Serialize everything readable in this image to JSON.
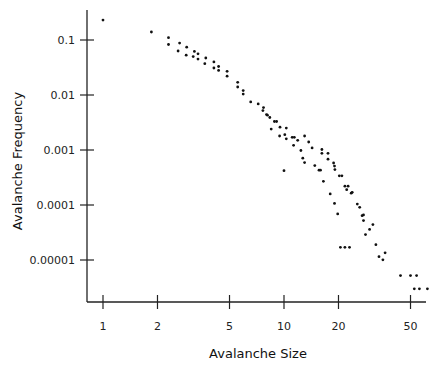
{
  "chart_data": {
    "type": "scatter",
    "title": "",
    "xlabel": "Avalanche Size",
    "ylabel": "Avalanche Frequency",
    "xscale": "log",
    "yscale": "log",
    "xlim": [
      0.88,
      60
    ],
    "ylim": [
      1.8e-06,
      0.36
    ],
    "grid": false,
    "legend": null,
    "x_ticks": [
      {
        "value": 1,
        "label": "1"
      },
      {
        "value": 2,
        "label": "2"
      },
      {
        "value": 5,
        "label": "5"
      },
      {
        "value": 10,
        "label": "10"
      },
      {
        "value": 20,
        "label": "20"
      },
      {
        "value": 50,
        "label": "50"
      }
    ],
    "y_ticks": [
      {
        "value": 0.1,
        "label": "0.1"
      },
      {
        "value": 0.01,
        "label": "0.01"
      },
      {
        "value": 0.001,
        "label": "0.001"
      },
      {
        "value": 0.0001,
        "label": "0.0001"
      },
      {
        "value": 1e-05,
        "label": "0.00001"
      }
    ],
    "points": [
      [
        1.0,
        0.23
      ],
      [
        1.85,
        0.14
      ],
      [
        2.3,
        0.11
      ],
      [
        2.3,
        0.083
      ],
      [
        2.65,
        0.088
      ],
      [
        2.6,
        0.063
      ],
      [
        2.9,
        0.074
      ],
      [
        2.88,
        0.053
      ],
      [
        3.2,
        0.062
      ],
      [
        3.15,
        0.05
      ],
      [
        3.35,
        0.056
      ],
      [
        3.35,
        0.045
      ],
      [
        3.7,
        0.047
      ],
      [
        3.65,
        0.037
      ],
      [
        4.1,
        0.04
      ],
      [
        4.1,
        0.031
      ],
      [
        4.35,
        0.033
      ],
      [
        4.35,
        0.028
      ],
      [
        4.85,
        0.027
      ],
      [
        4.85,
        0.022
      ],
      [
        5.55,
        0.017
      ],
      [
        5.55,
        0.014
      ],
      [
        5.95,
        0.012
      ],
      [
        5.95,
        0.0104
      ],
      [
        6.55,
        0.0075
      ],
      [
        7.2,
        0.0069
      ],
      [
        7.7,
        0.0059
      ],
      [
        7.65,
        0.0052
      ],
      [
        8.0,
        0.0044
      ],
      [
        8.35,
        0.0039
      ],
      [
        8.1,
        0.0043
      ],
      [
        8.85,
        0.0033
      ],
      [
        9.1,
        0.0033
      ],
      [
        8.5,
        0.0024
      ],
      [
        9.5,
        0.0026
      ],
      [
        10.3,
        0.0025
      ],
      [
        10.1,
        0.0019
      ],
      [
        10.3,
        0.0016
      ],
      [
        9.45,
        0.0018
      ],
      [
        11.1,
        0.0017
      ],
      [
        11.4,
        0.0017
      ],
      [
        11.9,
        0.0015
      ],
      [
        13.0,
        0.0018
      ],
      [
        11.3,
        0.00122
      ],
      [
        13.7,
        0.0014
      ],
      [
        14.3,
        0.00109
      ],
      [
        16.2,
        0.00102
      ],
      [
        12.4,
        0.00098
      ],
      [
        16.2,
        0.00087
      ],
      [
        12.7,
        0.00071
      ],
      [
        17.5,
        0.00087
      ],
      [
        13.0,
        0.00059
      ],
      [
        17.5,
        0.00068
      ],
      [
        14.8,
        0.00052
      ],
      [
        18.8,
        0.00058
      ],
      [
        19.0,
        0.00051
      ],
      [
        10.0,
        0.00042
      ],
      [
        15.6,
        0.00043
      ],
      [
        15.9,
        0.00043
      ],
      [
        19.1,
        0.00044
      ],
      [
        20.2,
        0.00034
      ],
      [
        20.9,
        0.00034
      ],
      [
        16.5,
        0.00027
      ],
      [
        21.7,
        0.00022
      ],
      [
        22.6,
        0.00022
      ],
      [
        22.2,
        0.00019
      ],
      [
        18.0,
        0.000159
      ],
      [
        23.5,
        0.000164
      ],
      [
        23.8,
        0.00017
      ],
      [
        19.0,
        0.000107
      ],
      [
        25.4,
        0.000104
      ],
      [
        26.2,
        9.1e-05
      ],
      [
        27.0,
        6.4e-05
      ],
      [
        19.8,
        6.9e-05
      ],
      [
        27.5,
        6.6e-05
      ],
      [
        27.5,
        5.2e-05
      ],
      [
        31.0,
        4.4e-05
      ],
      [
        28.2,
        2.9e-05
      ],
      [
        29.7,
        3.6e-05
      ],
      [
        20.5,
        1.7e-05
      ],
      [
        21.7,
        1.7e-05
      ],
      [
        23.0,
        1.7e-05
      ],
      [
        32.2,
        1.9e-05
      ],
      [
        33.5,
        1.15e-05
      ],
      [
        36.2,
        1.35e-05
      ],
      [
        35.2,
        1.01e-05
      ],
      [
        44.0,
        5.2e-06
      ],
      [
        50.0,
        5.2e-06
      ],
      [
        54.0,
        5.2e-06
      ],
      [
        52.5,
        3e-06
      ],
      [
        56.0,
        3e-06
      ],
      [
        62.0,
        3e-06
      ]
    ]
  }
}
